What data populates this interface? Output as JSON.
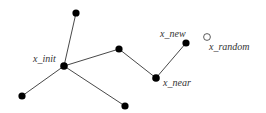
{
  "diagram": {
    "title": "",
    "nodes": [
      {
        "id": "n_top",
        "x": 76,
        "y": 13,
        "filled": true,
        "label": ""
      },
      {
        "id": "x_init",
        "x": 64,
        "y": 66,
        "filled": true,
        "label": "x_init"
      },
      {
        "id": "n_left",
        "x": 22,
        "y": 96,
        "filled": true,
        "label": ""
      },
      {
        "id": "n_mid",
        "x": 119,
        "y": 49,
        "filled": true,
        "label": ""
      },
      {
        "id": "n_bottom",
        "x": 125,
        "y": 106,
        "filled": true,
        "label": ""
      },
      {
        "id": "x_near",
        "x": 156,
        "y": 78,
        "filled": true,
        "label": "x_near"
      },
      {
        "id": "x_new",
        "x": 186,
        "y": 43,
        "filled": true,
        "label": "x_new"
      },
      {
        "id": "x_random",
        "x": 207,
        "y": 37,
        "filled": false,
        "label": "x_random"
      }
    ],
    "edges": [
      [
        "x_init",
        "n_top"
      ],
      [
        "x_init",
        "n_left"
      ],
      [
        "x_init",
        "n_mid"
      ],
      [
        "x_init",
        "n_bottom"
      ],
      [
        "n_mid",
        "x_near"
      ],
      [
        "x_near",
        "x_new"
      ]
    ],
    "labels": {
      "x_init": "x_init",
      "x_near": "x_near",
      "x_new": "x_new",
      "x_random": "x_random"
    }
  }
}
